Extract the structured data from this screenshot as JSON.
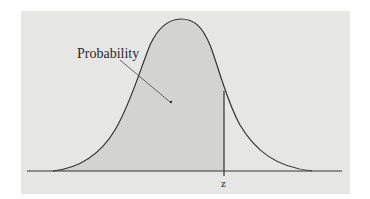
{
  "diagram": {
    "type": "normal-distribution-area",
    "annotation_label": "Probability",
    "z_label": "z",
    "colors": {
      "background": "#e6e6e4",
      "shaded_area": "#d4d4d2",
      "curve": "#333333"
    }
  }
}
